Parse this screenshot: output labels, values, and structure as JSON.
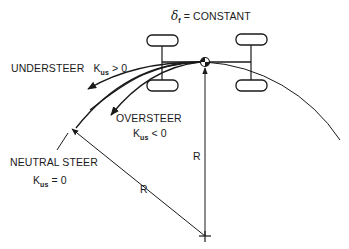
{
  "labels": {
    "steer_symbol": "δ",
    "steer_subscript": "f",
    "steer_condition": "= CONSTANT",
    "understeer": "UNDERSTEER",
    "understeer_k": "K",
    "understeer_k_sub": "us",
    "understeer_cond": "> 0",
    "oversteer": "OVERSTEER",
    "oversteer_k": "K",
    "oversteer_k_sub": "us",
    "oversteer_cond": "< 0",
    "neutral": "NEUTRAL  STEER",
    "neutral_k": "K",
    "neutral_k_sub": "us",
    "neutral_cond": "= 0",
    "radius_1": "R",
    "radius_2": "R"
  },
  "colors": {
    "line": "#1a1a1a",
    "background": "#ffffff"
  },
  "icons": {
    "cg_marker": "center-of-gravity-icon",
    "center_marker": "turn-center-cross-icon"
  }
}
